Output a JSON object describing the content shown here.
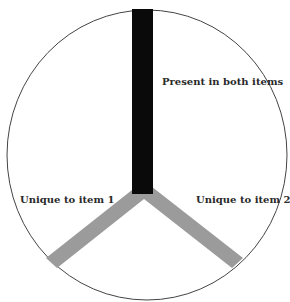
{
  "diagram": {
    "type": "y-shaped venn-like partition in circle",
    "labels": {
      "shared": "Present in both items",
      "left": "Unique to item 1",
      "right": "Unique to item 2"
    },
    "colors": {
      "circle_stroke": "#444444",
      "shared_bar": "#0a0a0a",
      "unique_bars": "#9b9b9b",
      "background": "#ffffff"
    }
  }
}
